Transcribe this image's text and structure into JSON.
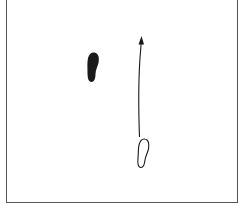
{
  "diagram": {
    "colors": {
      "frame": "#555555",
      "ink": "#1a1a1a",
      "background": "#ffffff"
    },
    "elements": [
      {
        "id": "start-footprint",
        "style": "filled",
        "center": [
          92,
          67
        ],
        "size": [
          12,
          30
        ]
      },
      {
        "id": "movement-arrow",
        "direction": "up",
        "from": [
          139,
          137
        ],
        "to": [
          141,
          36
        ]
      },
      {
        "id": "end-footprint",
        "style": "outline",
        "center": [
          143,
          153
        ],
        "size": [
          12,
          30
        ]
      }
    ]
  }
}
